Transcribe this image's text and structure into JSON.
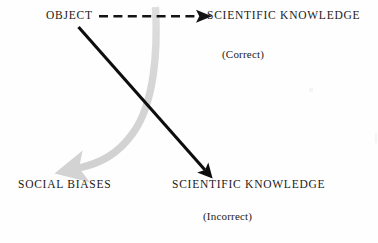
{
  "diagram": {
    "background_color": "#fefefe",
    "nodes": {
      "object": "OBJECT",
      "scientific_knowledge_correct": "SCIENTIFIC KNOWLEDGE",
      "correct_annotation": "(Correct)",
      "social_biases": "SOCIAL BIASES",
      "scientific_knowledge_incorrect": "SCIENTIFIC KNOWLEDGE",
      "incorrect_annotation": "(Incorrect)"
    },
    "arrows": [
      {
        "name": "dashed-arrow-object-to-knowledge",
        "style": "dashed",
        "color": "#141414",
        "from": "OBJECT",
        "to": "SCIENTIFIC KNOWLEDGE"
      },
      {
        "name": "solid-diagonal-arrow-object-to-incorrect-knowledge",
        "style": "solid",
        "color": "#0d0d0d",
        "from": "OBJECT",
        "to": "SCIENTIFIC KNOWLEDGE"
      },
      {
        "name": "curved-gray-arrow-to-social-biases",
        "style": "curved",
        "color": "#d9d9d9",
        "from": "OBJECT",
        "to": "SOCIAL BIASES"
      }
    ]
  }
}
